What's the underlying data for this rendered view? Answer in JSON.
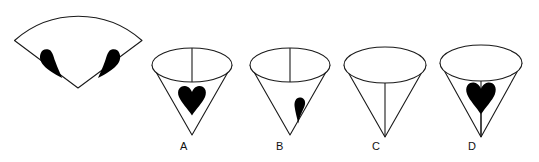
{
  "figure": {
    "kind": "spatial-reasoning-cone-net-question",
    "stroke_color": "#1a1a1a",
    "fill_color": "#000000",
    "background_color": "#ffffff",
    "stroke_width": 1,
    "prompt_shape": {
      "name": "flat-sector-net",
      "description": "circular sector (unrolled cone net) with two black half-heart marks near the lower straight edges",
      "arc_top_y": 10,
      "left_corner": [
        14,
        40
      ],
      "right_corner": [
        142,
        40
      ],
      "apex": [
        78,
        88
      ],
      "marks": [
        {
          "name": "half-heart-left",
          "x": 40,
          "y": 48,
          "w": 22,
          "h": 30
        },
        {
          "name": "half-heart-right",
          "x": 98,
          "y": 48,
          "w": 22,
          "h": 30
        }
      ]
    },
    "options": [
      {
        "id": "A",
        "label": "A",
        "label_x": 180,
        "label_y": 143,
        "cx": 192,
        "ellipse_cy": 65,
        "ellipse_rx": 40,
        "ellipse_ry": 17,
        "apex_y": 135,
        "seam": "ellipse-only",
        "mark": "full-heart",
        "mark_cx": 192,
        "mark_cy": 101,
        "mark_w": 28,
        "mark_h": 30
      },
      {
        "id": "B",
        "label": "B",
        "label_x": 276,
        "label_y": 143,
        "cx": 290,
        "ellipse_cy": 65,
        "ellipse_rx": 40,
        "ellipse_ry": 17,
        "apex_y": 135,
        "seam": "ellipse-only",
        "mark": "half-heart",
        "mark_cx": 300,
        "mark_cy": 110,
        "mark_w": 13,
        "mark_h": 27
      },
      {
        "id": "C",
        "label": "C",
        "label_x": 372,
        "label_y": 143,
        "cx": 385,
        "ellipse_cy": 65,
        "ellipse_rx": 41,
        "ellipse_ry": 18,
        "apex_y": 137,
        "seam": "ellipse-to-apex",
        "mark": "none"
      },
      {
        "id": "D",
        "label": "D",
        "label_x": 468,
        "label_y": 143,
        "cx": 481,
        "ellipse_cy": 63,
        "ellipse_rx": 41,
        "ellipse_ry": 18,
        "apex_y": 137,
        "seam": "ellipse-to-apex",
        "mark": "full-heart",
        "mark_cx": 481,
        "mark_cy": 98,
        "mark_w": 30,
        "mark_h": 32
      }
    ]
  }
}
